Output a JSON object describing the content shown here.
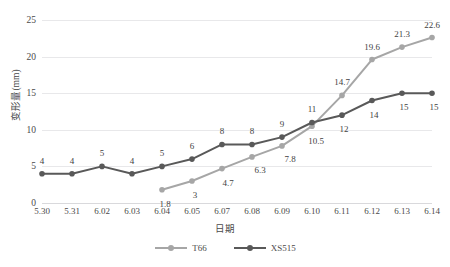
{
  "chart_data": {
    "type": "line",
    "title": "",
    "xlabel": "日期",
    "ylabel": "变形量(mm)",
    "categories": [
      "5.30",
      "5.31",
      "6.02",
      "6.03",
      "6.04",
      "6.05",
      "6.07",
      "6.08",
      "6.09",
      "6.10",
      "6.11",
      "6.12",
      "6.13",
      "6.14"
    ],
    "ylim": [
      0,
      25
    ],
    "yticks": [
      0,
      5,
      10,
      15,
      20,
      25
    ],
    "ytick_labels": [
      "0",
      "5",
      "10",
      "15",
      "20",
      "25"
    ],
    "grid": true,
    "legend_position": "bottom",
    "series": [
      {
        "name": "T66",
        "color": "#a6a6a6",
        "marker": "circle",
        "values": [
          null,
          null,
          null,
          null,
          1.8,
          3,
          4.7,
          6.3,
          7.8,
          10.5,
          14.7,
          19.6,
          21.3,
          22.6
        ],
        "labels": [
          "",
          "",
          "",
          "",
          "1.8",
          "3",
          "4.7",
          "6.3",
          "7.8",
          "10.5",
          "14.7",
          "19.6",
          "21.3",
          "22.6"
        ]
      },
      {
        "name": "XS515",
        "color": "#595959",
        "marker": "circle",
        "values": [
          4,
          4,
          5,
          4,
          5,
          6,
          8,
          8,
          9,
          11,
          12,
          14,
          15,
          15
        ],
        "labels": [
          "4",
          "4",
          "5",
          "4",
          "5",
          "6",
          "8",
          "8",
          "9",
          "11",
          "12",
          "14",
          "15",
          "15"
        ]
      }
    ]
  },
  "legend": {
    "items": [
      {
        "label": "T66",
        "color": "#a6a6a6"
      },
      {
        "label": "XS515",
        "color": "#595959"
      }
    ]
  },
  "colors": {
    "t66": "#a6a6a6",
    "xs515": "#595959",
    "gridline": "#e8e8ea",
    "text": "#4a4a4a",
    "background": "#ffffff"
  }
}
